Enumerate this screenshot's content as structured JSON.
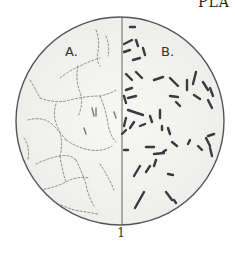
{
  "page": {
    "header_fragment": "PLA",
    "figure_number": "1"
  },
  "figure": {
    "type": "microscope-field",
    "circle": {
      "cx": 120,
      "cy": 121,
      "r": 104,
      "stroke": "#555555",
      "fill": "#f3f3f1"
    },
    "divider_x": 122,
    "panels": [
      {
        "id": "a",
        "label": "A.",
        "content": "fine chain-like bacterial strands"
      },
      {
        "id": "b",
        "label": "B.",
        "content": "scattered rod-shaped bacilli"
      }
    ],
    "colors": {
      "rod": "#3a3a3a",
      "chain": "#8a8a8a",
      "background": "#ffffff"
    }
  }
}
